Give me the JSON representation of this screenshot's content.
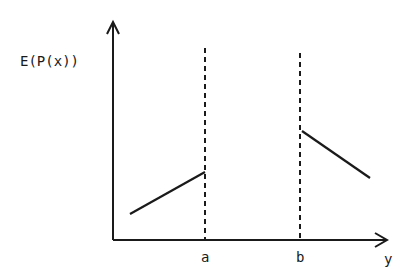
{
  "diagram": {
    "y_axis_label": "E(P(x))",
    "x_axis_label": "y",
    "markers": [
      {
        "label": "a"
      },
      {
        "label": "b"
      }
    ],
    "segments": [
      {
        "name": "left-segment",
        "description": "rising line ending at a"
      },
      {
        "name": "right-segment",
        "description": "falling line starting at b"
      }
    ],
    "colors": {
      "ink": "#1a1a1a",
      "background": "#ffffff"
    }
  }
}
